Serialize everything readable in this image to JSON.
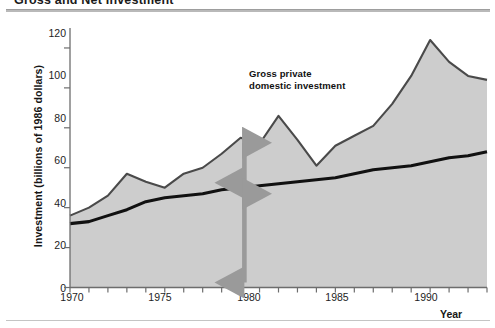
{
  "figure": {
    "title": "Gross and Net Investment",
    "xlabel": "Year",
    "ylabel": "Investment (billions of 1986 dollars)"
  },
  "annotations": {
    "gross": "Gross private\ndomestic investment",
    "net": "Net\ninvestment",
    "replacement": "Replacement\ninvestment"
  },
  "ticks": {
    "y": [
      "0",
      "20",
      "40",
      "60",
      "80",
      "100",
      "120"
    ],
    "x": [
      "1970",
      "1975",
      "1980",
      "1985",
      "1990"
    ]
  },
  "colors": {
    "area_fill": "#cdcdcd",
    "gross_line": "#4a4a4a",
    "net_line": "#111111",
    "arrow": "#9a9a9a",
    "axis": "#6d6d6d",
    "text": "#161616"
  },
  "chart_data": {
    "type": "area",
    "title": "Gross and Net Investment",
    "xlabel": "Year",
    "ylabel": "Investment (billions of 1986 dollars)",
    "xlim": [
      1970,
      1992
    ],
    "ylim": [
      0,
      130
    ],
    "yticks": [
      0,
      20,
      40,
      60,
      80,
      100,
      120
    ],
    "xticks": [
      1970,
      1975,
      1980,
      1985,
      1990
    ],
    "grid": false,
    "legend": "none (inline annotations)",
    "x": [
      1970,
      1971,
      1972,
      1973,
      1974,
      1975,
      1976,
      1977,
      1978,
      1979,
      1980,
      1981,
      1982,
      1983,
      1984,
      1985,
      1986,
      1987,
      1988,
      1989,
      1990,
      1991,
      1992
    ],
    "series": [
      {
        "name": "Gross private domestic investment",
        "values": [
          36,
          40,
          46,
          57,
          53,
          50,
          57,
          60,
          67,
          75,
          72,
          86,
          74,
          61,
          71,
          76,
          81,
          92,
          106,
          124,
          113,
          106,
          104
        ]
      },
      {
        "name": "Replacement investment (capital consumption)",
        "values": [
          32,
          33,
          36,
          39,
          43,
          45,
          46,
          47,
          49,
          50,
          51,
          52,
          53,
          54,
          55,
          57,
          59,
          60,
          61,
          63,
          65,
          66,
          68
        ]
      }
    ],
    "derived_series": [
      {
        "name": "Net investment",
        "definition": "Gross private domestic investment minus replacement investment",
        "values": [
          4,
          7,
          10,
          18,
          10,
          5,
          11,
          13,
          18,
          25,
          21,
          34,
          21,
          7,
          16,
          19,
          22,
          32,
          45,
          61,
          48,
          40,
          36
        ]
      }
    ],
    "annotations": [
      {
        "text": "Gross private domestic investment",
        "x": 1979.0,
        "y": 98
      },
      {
        "text": "Net investment",
        "x": 1979.2,
        "y": 63,
        "marker": "double-headed vertical arrow between gross and replacement curves at 1979"
      },
      {
        "text": "Replacement investment",
        "x": 1979.2,
        "y": 27,
        "marker": "double-headed vertical arrow from zero to replacement curve at 1979"
      }
    ]
  }
}
